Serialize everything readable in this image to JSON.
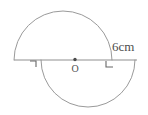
{
  "figure": {
    "background_color": "#ffffff",
    "stroke_color": "#9a9a9a",
    "text_color": "#4d4d4d",
    "labels": {
      "measure": "6cm",
      "center_point": "O"
    },
    "annotations": {
      "left_tick": "right-angle-tick-left",
      "right_tick": "right-angle-tick-right",
      "center_marker": "center-dot"
    }
  },
  "geometry": {
    "type": "diagram",
    "shape": "two overlapping semicircles on a common horizontal diameter line",
    "baseline": {
      "y": 60,
      "x_start": 14,
      "x_end": 137
    },
    "upper_semicircle": {
      "center_x": 63,
      "center_y": 60,
      "radius": 49,
      "orientation": "above-baseline",
      "arc_start_x": 14,
      "arc_end_x": 112,
      "apex_y": 11
    },
    "lower_semicircle": {
      "center_x": 88,
      "center_y": 60,
      "radius": 47,
      "orientation": "below-baseline",
      "arc_start_x": 41,
      "arc_end_x": 135,
      "apex_y": 107
    },
    "center_dot": {
      "x": 75,
      "y": 60,
      "r": 1.6
    },
    "measure_label_pos": {
      "x": 112,
      "y": 50
    },
    "center_label_pos": {
      "x": 76,
      "y": 71
    },
    "left_tick_pos": {
      "x": 35,
      "y": 60
    },
    "right_tick_pos": {
      "x": 110,
      "y": 60
    }
  }
}
